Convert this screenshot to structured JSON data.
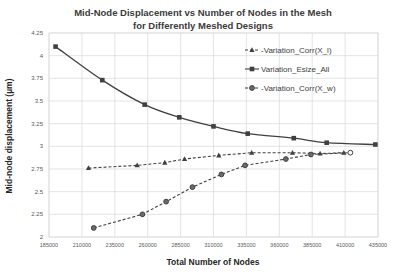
{
  "chart_data": {
    "type": "line",
    "title": "Mid-Node Displacement vs Number of Nodes in the Mesh",
    "subtitle": "for Differently Meshed Designs",
    "xlabel": "Total Number of Nodes",
    "ylabel": "Mid-node displacement (µm)",
    "xlim": [
      185000,
      435000
    ],
    "ylim": [
      2,
      4.25
    ],
    "x_ticks": [
      "185000",
      "210000",
      "235000",
      "260000",
      "285000",
      "310000",
      "335000",
      "360000",
      "385000",
      "410000",
      "435000"
    ],
    "y_ticks": [
      "2",
      "2.25",
      "2.5",
      "2.75",
      "3",
      "3.25",
      "3.5",
      "3.75",
      "4",
      "4.25"
    ],
    "grid": true,
    "legend_position": "upper right (inside)",
    "series": [
      {
        "name": "Variation_Corr(X_l)",
        "marker": "triangle",
        "line_style": "dashed",
        "x": [
          215000,
          252000,
          273000,
          288000,
          314000,
          339000,
          370000,
          391000,
          409000
        ],
        "y": [
          2.76,
          2.79,
          2.82,
          2.86,
          2.9,
          2.93,
          2.93,
          2.92,
          2.93
        ]
      },
      {
        "name": "Variation_Esize_All",
        "marker": "square",
        "line_style": "solid",
        "x": [
          190000,
          225500,
          257700,
          284000,
          310000,
          336000,
          371000,
          396000,
          433000
        ],
        "y": [
          4.1,
          3.73,
          3.46,
          3.32,
          3.22,
          3.14,
          3.09,
          3.04,
          3.02
        ]
      },
      {
        "name": "Variation_Corr(X_w)",
        "marker": "circle",
        "line_style": "dashed",
        "x": [
          219000,
          256000,
          274000,
          294000,
          316000,
          334000,
          365000,
          384000,
          414000
        ],
        "y": [
          2.1,
          2.25,
          2.39,
          2.55,
          2.69,
          2.79,
          2.86,
          2.91,
          2.93
        ]
      }
    ]
  },
  "labels": {
    "title_line1": "Mid-Node Displacement vs Number of Nodes in the Mesh",
    "title_line2": "for Differently Meshed Designs",
    "xlabel": "Total Number of Nodes",
    "ylabel": "Mid-node displacement (µm)",
    "legend": [
      "-Variation_Corr(X_l)",
      "Variation_Esize_All",
      "-Variation_Corr(X_w)"
    ]
  },
  "colors": {
    "series_line": "#404040",
    "grid": "#d9d9d9",
    "axis_text": "#595959"
  }
}
